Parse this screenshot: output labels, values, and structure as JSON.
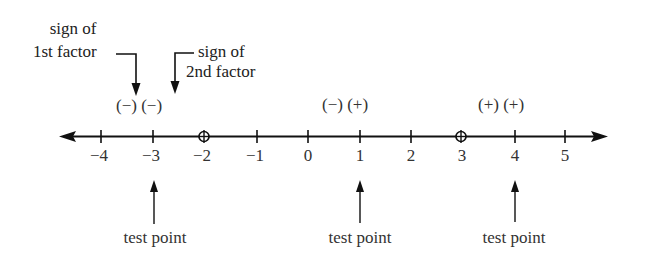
{
  "diagram": {
    "type": "sign-chart-number-line",
    "number_line": {
      "ticks": [
        "-4",
        "-3",
        "-2",
        "-1",
        "0",
        "1",
        "2",
        "3",
        "4",
        "5"
      ],
      "tick_values": [
        -4,
        -3,
        -2,
        -1,
        0,
        1,
        2,
        3,
        4,
        5
      ],
      "open_circles_at": [
        -2,
        3
      ],
      "arrows_both_ends": true
    },
    "annotations": {
      "first_factor_line1": "sign of",
      "first_factor_line2": "1st factor",
      "second_factor_line1": "sign of",
      "second_factor_line2": "2nd factor"
    },
    "intervals": [
      {
        "sign_text": "(−) (−)",
        "test_point_value": -3,
        "test_point_label": "test point"
      },
      {
        "sign_text": "(−) (+)",
        "test_point_value": 1,
        "test_point_label": "test point"
      },
      {
        "sign_text": "(+) (+)",
        "test_point_value": 4,
        "test_point_label": "test point"
      }
    ],
    "tick_labels": [
      "−4",
      "−3",
      "−2",
      "−1",
      "0",
      "1",
      "2",
      "3",
      "4",
      "5"
    ]
  }
}
